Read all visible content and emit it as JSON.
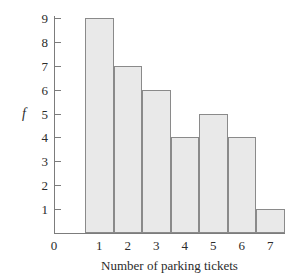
{
  "chart_data": {
    "type": "bar",
    "title": "",
    "xlabel": "Number of parking tickets",
    "ylabel": "f",
    "categories": [
      "1",
      "2",
      "3",
      "4",
      "5",
      "6",
      "7"
    ],
    "values": [
      9,
      7,
      6,
      4,
      5,
      4,
      1
    ],
    "x_tick_labels": [
      "0",
      "1",
      "2",
      "3",
      "4",
      "5",
      "6",
      "7"
    ],
    "y_tick_labels": [
      "9",
      "8",
      "7",
      "6",
      "5",
      "4",
      "3",
      "2",
      "1"
    ],
    "y_tick_values": [
      9,
      8,
      7,
      6,
      5,
      4,
      3,
      2,
      1
    ],
    "ylim": [
      0,
      9
    ],
    "grid": false,
    "legend": null,
    "bar_fill_color": "#e9e9e9",
    "bar_border_color": "#8a8a8a",
    "axis_color": "#7c7c7c",
    "text_color": "#2b2b2b"
  }
}
